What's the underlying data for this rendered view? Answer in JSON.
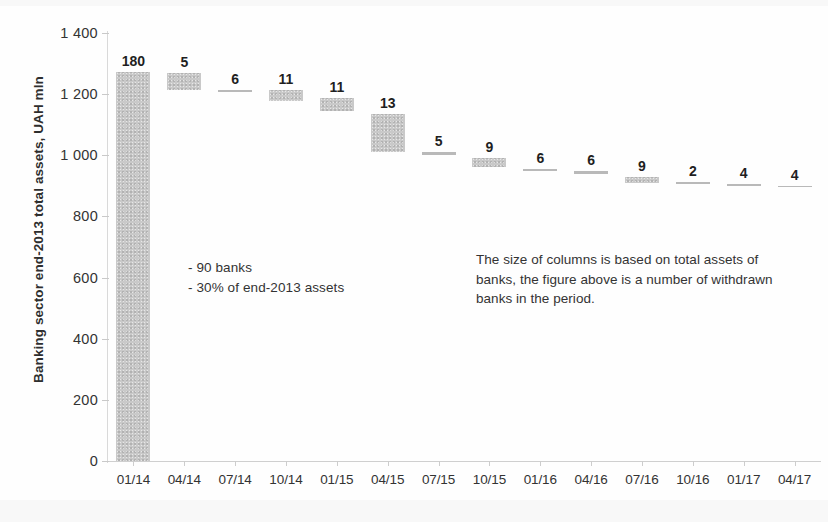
{
  "chart_data": {
    "type": "bar",
    "subtype": "waterfall",
    "title": "",
    "xlabel": "",
    "ylabel": "Banking sector end-2013 total assets, UAH mln",
    "ylim": [
      0,
      1400
    ],
    "ytick_step": 200,
    "yticks": [
      "0",
      "200",
      "400",
      "600",
      "800",
      "1 000",
      "1 200",
      "1 400"
    ],
    "ytick_values": [
      0,
      200,
      400,
      600,
      800,
      1000,
      1200,
      1400
    ],
    "grid": false,
    "legend": "none",
    "bar_color": "#c9c9c9",
    "categories": [
      "01/14",
      "04/14",
      "07/14",
      "10/14",
      "01/15",
      "04/15",
      "07/15",
      "10/15",
      "01/16",
      "04/16",
      "07/16",
      "10/16",
      "01/17",
      "04/17"
    ],
    "data_labels": [
      "180",
      "5",
      "6",
      "11",
      "11",
      "13",
      "5",
      "9",
      "6",
      "6",
      "9",
      "2",
      "4",
      "4"
    ],
    "label_meaning": "number of withdrawn banks in the period",
    "series": [
      {
        "name": "Total assets of withdrawn banks (waterfall level, UAH mln)",
        "bar_top": [
          1272,
          1268,
          1213,
          1212,
          1186,
          1136,
          1010,
          990,
          955,
          947,
          930,
          912,
          905,
          900
        ],
        "bar_bottom": [
          0,
          1215,
          1208,
          1177,
          1145,
          1012,
          1000,
          962,
          950,
          940,
          910,
          908,
          900,
          895
        ],
        "values": [
          1272,
          53,
          5,
          35,
          41,
          124,
          10,
          28,
          5,
          7,
          20,
          4,
          5,
          5
        ]
      }
    ],
    "annotations": [
      {
        "name": "withdrawn-banks-summary",
        "text": "- 90 banks\n- 30% of end-2013 assets"
      },
      {
        "name": "methodology-note",
        "text": "The size of columns is based on total assets of banks, the figure above is a number of withdrawn banks in the period."
      }
    ]
  }
}
